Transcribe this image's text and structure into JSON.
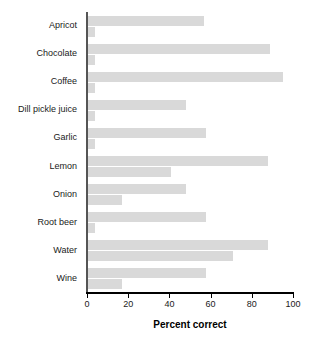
{
  "chart_data": {
    "type": "bar",
    "orientation": "horizontal",
    "title": "",
    "xlabel": "Percent correct",
    "ylabel": "",
    "xlim": [
      0,
      100
    ],
    "xticks": [
      0,
      20,
      40,
      60,
      80,
      100
    ],
    "grid": false,
    "legend": "none",
    "bar_color": "#d9d9d9",
    "categories": [
      "Apricot",
      "Chocolate",
      "Coffee",
      "Dill pickle juice",
      "Garlic",
      "Lemon",
      "Onion",
      "Root beer",
      "Water",
      "Wine"
    ],
    "series": [
      {
        "name": "series-1",
        "values": [
          57,
          89,
          95,
          48,
          58,
          88,
          48,
          58,
          88,
          58
        ]
      },
      {
        "name": "series-2",
        "values": [
          4,
          4,
          4,
          4,
          4,
          41,
          17,
          4,
          71,
          17
        ]
      }
    ]
  },
  "axis": {
    "tick_labels": [
      "0",
      "20",
      "40",
      "60",
      "80",
      "100"
    ],
    "title": "Percent correct"
  }
}
